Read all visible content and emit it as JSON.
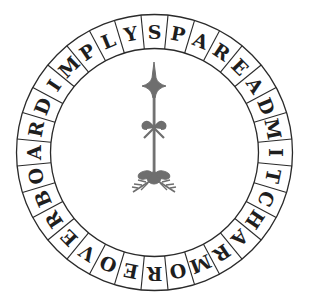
{
  "puzzle": {
    "type": "circular word chain",
    "cell_count": 32,
    "reading_direction": "clockwise from top",
    "letters": [
      "S",
      "P",
      "A",
      "R",
      "E",
      "A",
      "D",
      "M",
      "I",
      "T",
      "C",
      "H",
      "A",
      "R",
      "M",
      "O",
      "R",
      "E",
      "O",
      "V",
      "E",
      "R",
      "B",
      "O",
      "A",
      "R",
      "D",
      "I",
      "M",
      "P",
      "L",
      "Y"
    ],
    "start_offset_cells": 0.5
  },
  "geometry": {
    "cx": 154.5,
    "cy": 152.5,
    "outer_r": 138,
    "inner_r": 104
  },
  "ornament": {
    "name": "compass-needle-fleur",
    "color": "#6e6e6e"
  },
  "colors": {
    "line": "#2a2a2a",
    "text": "#1e1e1e",
    "background": "#ffffff"
  }
}
